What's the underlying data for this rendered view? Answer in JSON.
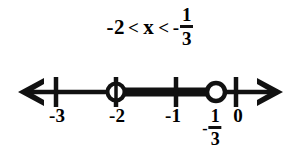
{
  "background_color": "#ffffff",
  "ink_color": "#111111",
  "inequality": {
    "left_value": "-2",
    "left_relation": "<",
    "variable": "x",
    "right_relation": "<",
    "right_sign": "-",
    "right_numerator": "1",
    "right_denominator": "3",
    "full_text": "-2 < x < -1/3"
  },
  "number_line": {
    "min_shown": -3.5,
    "max_shown": 0.5,
    "ticks": [
      {
        "value": "-3",
        "label": "-3",
        "x": 56
      },
      {
        "value": "-2",
        "label": "-2",
        "x": 116
      },
      {
        "value": "-1",
        "label": "-1",
        "x": 176
      },
      {
        "value": "0",
        "label": "0",
        "x": 236
      }
    ],
    "fraction_label": {
      "sign": "-",
      "numerator": "1",
      "denominator": "3",
      "x": 211
    },
    "endpoints": [
      {
        "value": "-2",
        "type": "open-circle",
        "x": 116,
        "on_tick": true
      },
      {
        "value": "-1/3",
        "type": "open-circle",
        "x": 216,
        "on_tick": false
      }
    ],
    "highlighted_segment": {
      "from": "-2",
      "to": "-1/3",
      "from_x": 116,
      "to_x": 216
    },
    "arrows": [
      {
        "direction": "left",
        "x": 18
      },
      {
        "direction": "right",
        "x": 283
      }
    ]
  }
}
